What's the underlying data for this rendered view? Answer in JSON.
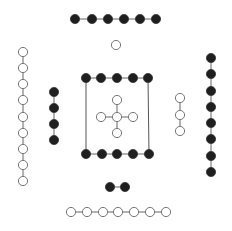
{
  "canvas": {
    "width": 232,
    "height": 231,
    "background": "#ffffff"
  },
  "style": {
    "node_radius": 4.6,
    "black_fill": "#1f1f1f",
    "white_fill": "#ffffff",
    "edge_color": "#666666"
  },
  "groups": [
    {
      "name": "top-black-row",
      "color": "black",
      "orientation": "horizontal",
      "nodes": [
        [
          75,
          19
        ],
        [
          92,
          19
        ],
        [
          108,
          19
        ],
        [
          124,
          19
        ],
        [
          140,
          19
        ],
        [
          156,
          19
        ]
      ]
    },
    {
      "name": "top-single-white",
      "color": "white",
      "orientation": "none",
      "nodes": [
        [
          116,
          45
        ]
      ]
    },
    {
      "name": "left-white-column",
      "color": "white",
      "orientation": "vertical",
      "nodes": [
        [
          23,
          52
        ],
        [
          23,
          68
        ],
        [
          23,
          84
        ],
        [
          23,
          100
        ],
        [
          23,
          117
        ],
        [
          23,
          133
        ],
        [
          23,
          149
        ],
        [
          23,
          165
        ],
        [
          23,
          181
        ]
      ]
    },
    {
      "name": "left-black-column",
      "color": "black",
      "orientation": "vertical",
      "nodes": [
        [
          54,
          92
        ],
        [
          54,
          108
        ],
        [
          54,
          124
        ],
        [
          54,
          140
        ]
      ]
    },
    {
      "name": "box-top-black-row",
      "color": "black",
      "orientation": "horizontal",
      "nodes": [
        [
          86,
          78
        ],
        [
          101,
          78
        ],
        [
          117,
          78
        ],
        [
          133,
          78
        ],
        [
          148,
          78
        ]
      ]
    },
    {
      "name": "box-bottom-black-row",
      "color": "black",
      "orientation": "horizontal",
      "nodes": [
        [
          86,
          154
        ],
        [
          102,
          154
        ],
        [
          117,
          154
        ],
        [
          133,
          154
        ],
        [
          149,
          154
        ]
      ]
    },
    {
      "name": "right-white-column",
      "color": "white",
      "orientation": "vertical",
      "nodes": [
        [
          180,
          98
        ],
        [
          180,
          115
        ],
        [
          180,
          131
        ]
      ]
    },
    {
      "name": "right-black-column",
      "color": "black",
      "orientation": "vertical",
      "nodes": [
        [
          211,
          58
        ],
        [
          211,
          74
        ],
        [
          211,
          91
        ],
        [
          211,
          107
        ],
        [
          211,
          123
        ],
        [
          211,
          139
        ],
        [
          211,
          156
        ],
        [
          211,
          172
        ]
      ]
    },
    {
      "name": "bottom-black-pair",
      "color": "black",
      "orientation": "horizontal",
      "nodes": [
        [
          110,
          187
        ],
        [
          125,
          187
        ]
      ]
    },
    {
      "name": "bottom-white-row",
      "color": "white",
      "orientation": "horizontal",
      "nodes": [
        [
          71,
          212
        ],
        [
          87,
          212
        ],
        [
          103,
          212
        ],
        [
          118,
          212
        ],
        [
          134,
          212
        ],
        [
          150,
          212
        ],
        [
          166,
          212
        ]
      ]
    }
  ],
  "cross": {
    "name": "center-white-cross",
    "color": "white",
    "center": [
      117,
      117
    ],
    "arms": [
      [
        117,
        100
      ],
      [
        101,
        117
      ],
      [
        133,
        117
      ],
      [
        117,
        133
      ]
    ]
  },
  "box": {
    "name": "center-box",
    "left": [
      86,
      78,
      86,
      154
    ],
    "right": [
      148,
      78,
      149,
      154
    ]
  }
}
